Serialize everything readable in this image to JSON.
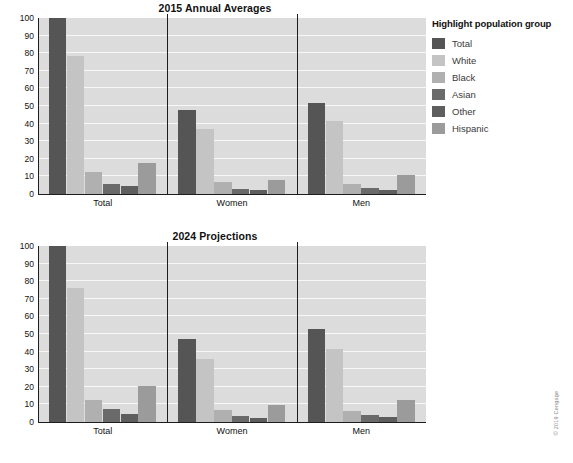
{
  "figure": {
    "credit": "© 2019 Cengage"
  },
  "legend": {
    "title": "Highlight population group",
    "items": [
      {
        "label": "Total",
        "color": "#555555"
      },
      {
        "label": "White",
        "color": "#c4c4c4"
      },
      {
        "label": "Black",
        "color": "#b0b0b0"
      },
      {
        "label": "Asian",
        "color": "#6a6a6a"
      },
      {
        "label": "Other",
        "color": "#5e5e5e"
      },
      {
        "label": "Hispanic",
        "color": "#9b9b9b"
      }
    ]
  },
  "chart_data": [
    {
      "id": "chart-2015",
      "type": "bar",
      "title": "2015 Annual Averages",
      "xlabel": "",
      "ylabel": "Percent",
      "ylim": [
        0,
        100
      ],
      "yticks": [
        0,
        10,
        20,
        30,
        40,
        50,
        60,
        70,
        80,
        90,
        100
      ],
      "grid": true,
      "legend_position": "right",
      "categories": [
        "Total",
        "Women",
        "Men"
      ],
      "series": [
        {
          "name": "Total",
          "color": "#555555",
          "values": [
            100.0,
            47.5,
            51.8
          ]
        },
        {
          "name": "White",
          "color": "#c4c4c4",
          "values": [
            78.4,
            36.8,
            41.7
          ]
        },
        {
          "name": "Black",
          "color": "#b0b0b0",
          "values": [
            12.6,
            6.8,
            5.8
          ]
        },
        {
          "name": "Asian",
          "color": "#6a6a6a",
          "values": [
            5.9,
            3.0,
            3.4
          ]
        },
        {
          "name": "Other",
          "color": "#5e5e5e",
          "values": [
            4.3,
            2.0,
            2.2
          ]
        },
        {
          "name": "Hispanic",
          "color": "#9b9b9b",
          "values": [
            17.7,
            8.0,
            10.7
          ]
        }
      ]
    },
    {
      "id": "chart-2024",
      "type": "bar",
      "title": "2024 Projections",
      "xlabel": "",
      "ylabel": "Percent",
      "ylim": [
        0,
        100
      ],
      "yticks": [
        0,
        10,
        20,
        30,
        40,
        50,
        60,
        70,
        80,
        90,
        100
      ],
      "grid": true,
      "legend_position": "right",
      "categories": [
        "Total",
        "Women",
        "Men"
      ],
      "series": [
        {
          "name": "Total",
          "color": "#555555",
          "values": [
            100.0,
            47.2,
            52.9
          ]
        },
        {
          "name": "White",
          "color": "#c4c4c4",
          "values": [
            76.3,
            35.8,
            41.5
          ]
        },
        {
          "name": "Black",
          "color": "#b0b0b0",
          "values": [
            12.7,
            7.1,
            6.4
          ]
        },
        {
          "name": "Asian",
          "color": "#6a6a6a",
          "values": [
            7.2,
            3.6,
            4.2
          ]
        },
        {
          "name": "Other",
          "color": "#5e5e5e",
          "values": [
            4.8,
            2.5,
            3.0
          ]
        },
        {
          "name": "Hispanic",
          "color": "#9b9b9b",
          "values": [
            20.4,
            9.6,
            12.6
          ]
        }
      ]
    }
  ]
}
